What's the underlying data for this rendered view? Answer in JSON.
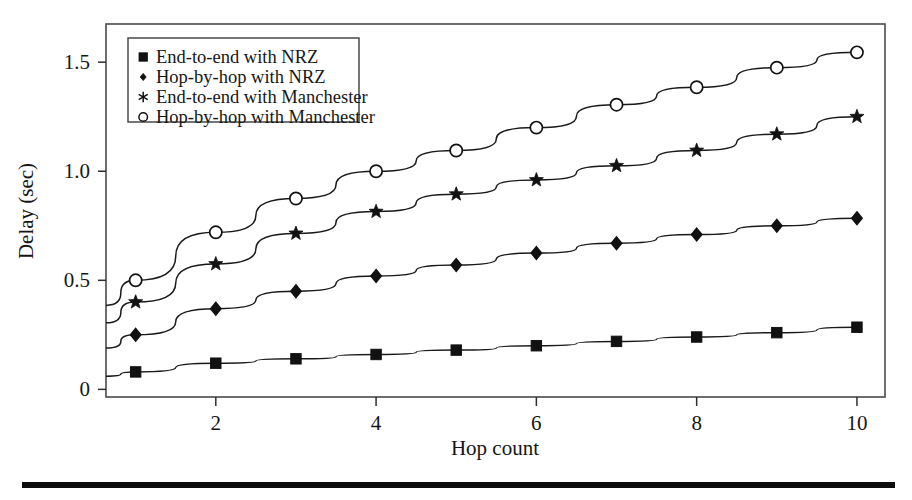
{
  "figure": {
    "background_color": "#ffffff",
    "frame_color": "#4a4a4a",
    "ink_color": "#161616",
    "rule_color": "#0d0d0d"
  },
  "chart_data": {
    "type": "line",
    "title": "",
    "xlabel": "Hop count",
    "ylabel": "Delay (sec)",
    "xlim": [
      0.63,
      10.35
    ],
    "ylim": [
      -0.035,
      1.675
    ],
    "xticks": [
      2,
      4,
      6,
      8,
      10
    ],
    "xtick_labels": [
      "2",
      "4",
      "6",
      "8",
      "10"
    ],
    "yticks": [
      0,
      0.5,
      1.0,
      1.5
    ],
    "ytick_labels": [
      "0",
      "0.5",
      "1.0",
      "1.5"
    ],
    "grid": false,
    "legend_position": "upper left",
    "x": [
      1,
      2,
      3,
      4,
      5,
      6,
      7,
      8,
      9,
      10
    ],
    "series": [
      {
        "name": "End-to-end with NRZ",
        "marker": "filled-square",
        "values": [
          0.08,
          0.12,
          0.14,
          0.16,
          0.18,
          0.2,
          0.22,
          0.24,
          0.26,
          0.285
        ],
        "left_edge_value": 0.06
      },
      {
        "name": "Hop-by-hop with NRZ",
        "marker": "filled-diamond",
        "values": [
          0.25,
          0.37,
          0.45,
          0.52,
          0.57,
          0.625,
          0.67,
          0.71,
          0.75,
          0.785
        ],
        "left_edge_value": 0.19
      },
      {
        "name": "End-to-end with Manchester",
        "marker": "star",
        "values": [
          0.4,
          0.575,
          0.715,
          0.815,
          0.895,
          0.96,
          1.025,
          1.095,
          1.17,
          1.25
        ],
        "left_edge_value": 0.305
      },
      {
        "name": "Hop-by-hop with Manchester",
        "marker": "open-circle",
        "values": [
          0.5,
          0.72,
          0.875,
          1.0,
          1.095,
          1.2,
          1.305,
          1.385,
          1.475,
          1.545
        ],
        "left_edge_value": 0.385
      }
    ]
  },
  "legend": {
    "entries": [
      {
        "label": "End-to-end with NRZ",
        "marker": "filled-square"
      },
      {
        "label": "Hop-by-hop with NRZ",
        "marker": "small-dot"
      },
      {
        "label": "End-to-end with Manchester",
        "marker": "asterisk"
      },
      {
        "label": "Hop-by-hop with Manchester",
        "marker": "open-circle"
      }
    ]
  }
}
